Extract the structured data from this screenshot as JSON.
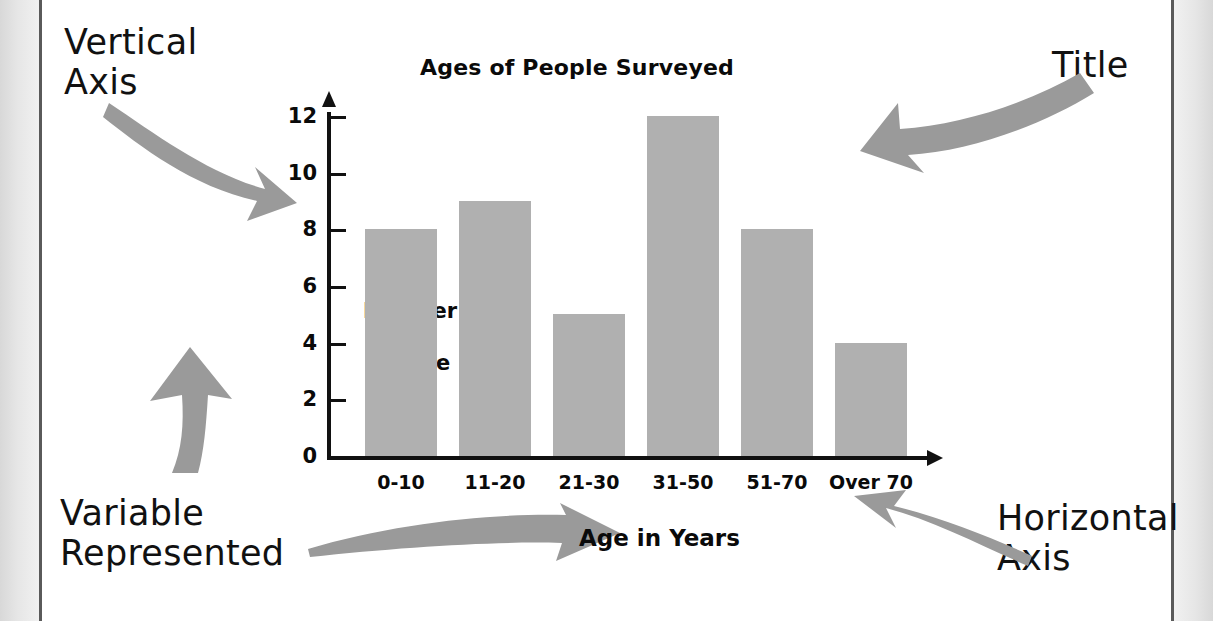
{
  "chart_data": {
    "type": "bar",
    "title": "Ages of People Surveyed",
    "xlabel": "Age in Years",
    "ylabel": "Number\nof\nPeople",
    "categories": [
      "0-10",
      "11-20",
      "21-30",
      "31-50",
      "51-70",
      "Over 70"
    ],
    "values": [
      8,
      9,
      5,
      12,
      8,
      4
    ],
    "yticks": [
      0,
      2,
      4,
      6,
      8,
      10,
      12
    ],
    "ylim": [
      0,
      12
    ],
    "grid": false,
    "legend": false,
    "bar_color": "#b0b0b0",
    "axis_color": "#111111"
  },
  "annotations": {
    "vertical_axis": "Vertical\nAxis",
    "title_callout": "Title",
    "variable_represented": "Variable\nRepresented",
    "horizontal_axis": "Horizontal\nAxis",
    "arrow_color": "#9a9a9a"
  }
}
